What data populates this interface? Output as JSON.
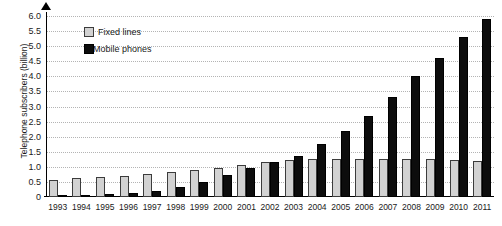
{
  "chart_data": {
    "type": "bar",
    "title": "",
    "subtitle": "",
    "xlabel": "",
    "ylabel": "Telephone subscribers (billion)",
    "ylim": [
      0,
      6.0
    ],
    "ytick_labels": [
      "6.0",
      "5.5",
      "5.0",
      "4.5",
      "4.0",
      "3.5",
      "3.0",
      "2.5",
      "2.0",
      "1.5",
      "1.0",
      "0.5",
      "0"
    ],
    "ytick_values": [
      6.0,
      5.5,
      5.0,
      4.5,
      4.0,
      3.5,
      3.0,
      2.5,
      2.0,
      1.5,
      1.0,
      0.5,
      0
    ],
    "grid": true,
    "grid_axis": "y",
    "legend_position": "top-left-inside",
    "categories": [
      "1993",
      "1994",
      "1995",
      "1996",
      "1997",
      "1998",
      "1999",
      "2000",
      "2001",
      "2002",
      "2003",
      "2004",
      "2005",
      "2006",
      "2007",
      "2008",
      "2009",
      "2010",
      "2011"
    ],
    "series": [
      {
        "name": "Fixed lines",
        "color": "#d2d2d2",
        "values": [
          0.58,
          0.62,
          0.66,
          0.7,
          0.75,
          0.82,
          0.88,
          0.95,
          1.05,
          1.15,
          1.22,
          1.25,
          1.25,
          1.26,
          1.26,
          1.26,
          1.25,
          1.22,
          1.2
        ]
      },
      {
        "name": "Mobile phones",
        "color": "#0d0d0d",
        "values": [
          0.03,
          0.06,
          0.09,
          0.14,
          0.21,
          0.32,
          0.5,
          0.72,
          0.95,
          1.15,
          1.35,
          1.75,
          2.2,
          2.7,
          3.3,
          4.0,
          4.6,
          5.3,
          5.9
        ]
      }
    ],
    "axis_arrow_icon": "triangle-up-icon"
  },
  "legend": {
    "items": [
      {
        "label": "Fixed lines",
        "swatch": "light-gray-square-icon"
      },
      {
        "label": "Mobile phones",
        "swatch": "black-square-icon"
      }
    ]
  }
}
